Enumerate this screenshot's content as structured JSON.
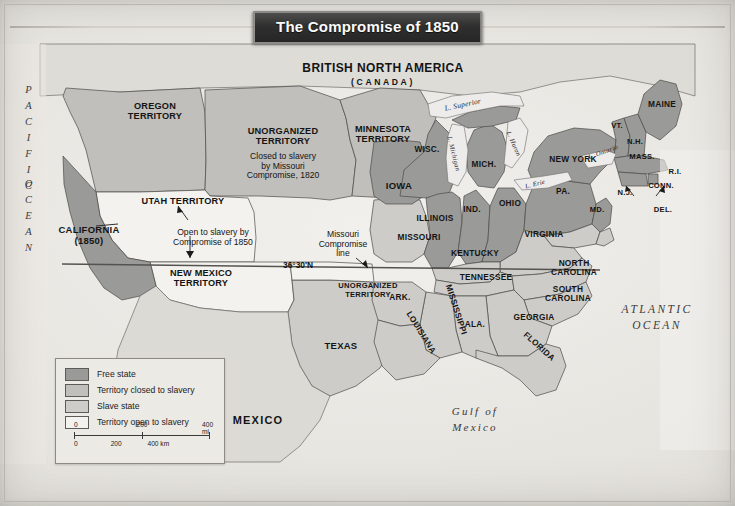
{
  "title": "The Compromise of 1850",
  "colors": {
    "free_state": "#9a9a98",
    "territory_closed": "#c0bfbb",
    "slave_state": "#cdccc8",
    "territory_open": "#f3f2ee",
    "water": "#edecea",
    "paper": "#e6e4df",
    "border": "#4a4a48",
    "plaque_bg": "#2f2f2f",
    "plaque_text": "#ffffff"
  },
  "legend": {
    "items": [
      {
        "label": "Free state",
        "swatch": "#9a9a98"
      },
      {
        "label": "Territory closed to slavery",
        "swatch": "#c0bfbb"
      },
      {
        "label": "Slave state",
        "swatch": "#cdccc8"
      },
      {
        "label": "Territory open to slavery",
        "swatch": "#f3f2ee"
      }
    ],
    "scale": {
      "miles": {
        "ticks": [
          "0",
          "200",
          "400 mi"
        ]
      },
      "km": {
        "ticks": [
          "0",
          "200",
          "400 km"
        ]
      }
    }
  },
  "regions": {
    "canada_line1": "BRITISH NORTH AMERICA",
    "canada_line2": "(CANADA)",
    "mexico": "MEXICO"
  },
  "oceans": {
    "pacific_line1": "PACIFIC",
    "pacific_line2": "OCEAN",
    "atlantic_line1": "ATLANTIC",
    "atlantic_line2": "OCEAN",
    "gulf_line1": "Gulf of",
    "gulf_line2": "Mexico"
  },
  "lakes": [
    {
      "name": "L. Superior"
    },
    {
      "name": "L. Michigan"
    },
    {
      "name": "L. Huron"
    },
    {
      "name": "L. Erie"
    },
    {
      "name": "L. Ontario"
    }
  ],
  "territories": [
    {
      "name": "OREGON\nTERRITORY"
    },
    {
      "name": "UNORGANIZED\nTERRITORY"
    },
    {
      "name": "MINNESOTA\nTERRITORY"
    },
    {
      "name": "UTAH TERRITORY"
    },
    {
      "name": "NEW MEXICO\nTERRITORY"
    },
    {
      "name": "UNORGANIZED\nTERRITORY"
    }
  ],
  "labels": {
    "oregon_territory": "OREGON\nTERRITORY",
    "unorganized_north": "UNORGANIZED\nTERRITORY",
    "unorganized_north_note": "Closed to slavery\nby Missouri\nCompromise, 1820",
    "minnesota_territory": "MINNESOTA\nTERRITORY",
    "utah_territory": "UTAH TERRITORY",
    "new_mexico_territory": "NEW MEXICO\nTERRITORY",
    "open_note": "Open to slavery by\nCompromise of 1850",
    "california": "CALIFORNIA\n(1850)",
    "unorganized_indian": "UNORGANIZED\nTERRITORY",
    "missouri_line_note": "Missouri\nCompromise\nline",
    "parallel": "36°30'N",
    "texas": "TEXAS"
  },
  "states": [
    {
      "name": "WISC.",
      "status": "free"
    },
    {
      "name": "MICH.",
      "status": "free"
    },
    {
      "name": "IOWA",
      "status": "free"
    },
    {
      "name": "ILLINOIS",
      "status": "free"
    },
    {
      "name": "IND.",
      "status": "free"
    },
    {
      "name": "OHIO",
      "status": "free"
    },
    {
      "name": "PA.",
      "status": "free"
    },
    {
      "name": "NEW YORK",
      "status": "free"
    },
    {
      "name": "MAINE",
      "status": "free"
    },
    {
      "name": "VT.",
      "status": "free"
    },
    {
      "name": "N.H.",
      "status": "free"
    },
    {
      "name": "MASS.",
      "status": "free"
    },
    {
      "name": "R.I.",
      "status": "free"
    },
    {
      "name": "CONN.",
      "status": "free"
    },
    {
      "name": "N.J.",
      "status": "free"
    },
    {
      "name": "CALIFORNIA",
      "status": "free"
    },
    {
      "name": "MISSOURI",
      "status": "slave"
    },
    {
      "name": "KENTUCKY",
      "status": "slave"
    },
    {
      "name": "VIRGINIA",
      "status": "slave"
    },
    {
      "name": "MD.",
      "status": "slave"
    },
    {
      "name": "DEL.",
      "status": "slave"
    },
    {
      "name": "TENNESSEE",
      "status": "slave"
    },
    {
      "name": "NORTH\nCAROLINA",
      "status": "slave"
    },
    {
      "name": "SOUTH\nCAROLINA",
      "status": "slave"
    },
    {
      "name": "GEORGIA",
      "status": "slave"
    },
    {
      "name": "ALA.",
      "status": "slave"
    },
    {
      "name": "MISSISSIPPI",
      "status": "slave"
    },
    {
      "name": "LOUISIANA",
      "status": "slave"
    },
    {
      "name": "ARK.",
      "status": "slave"
    },
    {
      "name": "FLORIDA",
      "status": "slave"
    },
    {
      "name": "TEXAS",
      "status": "slave"
    }
  ],
  "state_labels": {
    "wisc": "WISC.",
    "mich": "MICH.",
    "iowa": "IOWA",
    "illinois": "ILLINOIS",
    "ind": "IND.",
    "ohio": "OHIO",
    "pa": "PA.",
    "new_york": "NEW YORK",
    "maine": "MAINE",
    "vt": "VT.",
    "nh": "N.H.",
    "mass": "MASS.",
    "ri": "R.I.",
    "conn": "CONN.",
    "nj": "N.J.",
    "md": "MD.",
    "del": "DEL.",
    "missouri": "MISSOURI",
    "kentucky": "KENTUCKY",
    "virginia": "VIRGINIA",
    "tennessee": "TENNESSEE",
    "north_carolina": "NORTH\nCAROLINA",
    "south_carolina": "SOUTH\nCAROLINA",
    "georgia": "GEORGIA",
    "ala": "ALA.",
    "mississippi": "MISSISSIPPI",
    "louisiana": "LOUISIANA",
    "ark": "ARK.",
    "florida": "FLORIDA"
  }
}
